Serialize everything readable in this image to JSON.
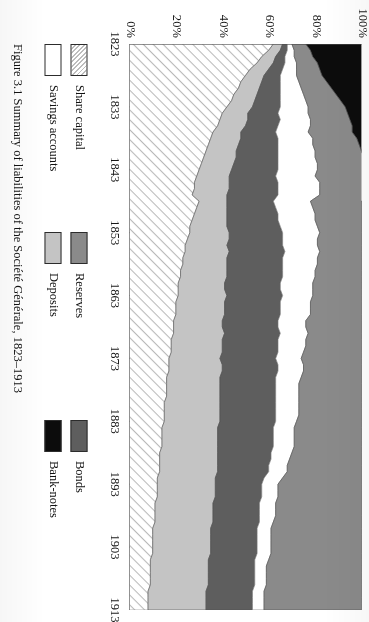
{
  "figure": {
    "caption": "Figure 3.1  Summary of liabilities of the Société Générale, 1823–1913"
  },
  "legend": {
    "columns": [
      {
        "entries": [
          {
            "label": "Share capital",
            "swatch": "hatch-diagonal",
            "color": "#ffffff"
          },
          {
            "label": "Savings accounts",
            "swatch": "solid-white",
            "color": "#ffffff"
          }
        ]
      },
      {
        "entries": [
          {
            "label": "Reserves",
            "swatch": "solid",
            "color": "#8a8a8a"
          },
          {
            "label": "Deposits",
            "swatch": "solid",
            "color": "#c4c4c4"
          }
        ]
      },
      {
        "entries": [
          {
            "label": "Bonds",
            "swatch": "solid",
            "color": "#5e5e5e"
          },
          {
            "label": "Bank-notes",
            "swatch": "solid",
            "color": "#0c0c0c"
          }
        ]
      }
    ]
  },
  "chart_data": {
    "type": "area",
    "stacked": true,
    "normalized": true,
    "title": "Summary of liabilities of the Société Générale, 1823–1913",
    "xlabel": "",
    "ylabel": "",
    "xlim": [
      1823,
      1913
    ],
    "ylim": [
      0,
      100
    ],
    "grid": false,
    "legend_position": "below-plot",
    "xticks": [
      "1823",
      "1833",
      "1843",
      "1853",
      "1863",
      "1873",
      "1883",
      "1893",
      "1903",
      "1913"
    ],
    "xtick_values": [
      1823,
      1833,
      1843,
      1853,
      1863,
      1873,
      1883,
      1893,
      1903,
      1913
    ],
    "yticks": [
      "0%",
      "20%",
      "40%",
      "60%",
      "80%",
      "100%"
    ],
    "ytick_values": [
      0,
      20,
      40,
      60,
      80,
      100
    ],
    "x": [
      1823,
      1824,
      1825,
      1826,
      1827,
      1828,
      1829,
      1830,
      1831,
      1832,
      1833,
      1834,
      1835,
      1836,
      1837,
      1838,
      1839,
      1840,
      1841,
      1842,
      1843,
      1844,
      1845,
      1846,
      1847,
      1848,
      1849,
      1850,
      1851,
      1852,
      1853,
      1854,
      1855,
      1856,
      1857,
      1858,
      1859,
      1860,
      1861,
      1862,
      1863,
      1864,
      1865,
      1866,
      1867,
      1868,
      1869,
      1870,
      1871,
      1872,
      1873,
      1874,
      1875,
      1876,
      1877,
      1878,
      1879,
      1880,
      1881,
      1882,
      1883,
      1884,
      1885,
      1886,
      1887,
      1888,
      1889,
      1890,
      1891,
      1892,
      1893,
      1894,
      1895,
      1896,
      1897,
      1898,
      1899,
      1900,
      1901,
      1902,
      1903,
      1904,
      1905,
      1906,
      1907,
      1908,
      1909,
      1910,
      1911,
      1912,
      1913
    ],
    "series": [
      {
        "name": "Share capital",
        "style": "hatch-diagonal",
        "color": "#ffffff",
        "values": [
          62,
          60,
          57,
          55,
          52,
          50,
          48,
          47,
          45,
          44,
          42,
          40,
          39,
          38,
          36,
          35,
          34,
          33,
          32,
          31,
          30,
          29,
          28,
          28,
          27,
          30,
          29,
          28,
          27,
          26,
          26,
          25,
          24,
          24,
          23,
          23,
          22,
          22,
          21,
          21,
          21,
          20,
          20,
          20,
          19,
          19,
          19,
          18,
          18,
          18,
          17,
          17,
          17,
          16,
          16,
          16,
          16,
          15,
          15,
          15,
          15,
          14,
          14,
          14,
          14,
          13,
          13,
          13,
          13,
          12,
          12,
          12,
          12,
          11,
          11,
          11,
          11,
          10,
          10,
          10,
          10,
          10,
          9,
          9,
          9,
          9,
          9,
          8,
          8,
          8,
          8
        ]
      },
      {
        "name": "Deposits",
        "style": "solid",
        "color": "#c4c4c4",
        "values": [
          4,
          5,
          6,
          7,
          8,
          8,
          9,
          9,
          10,
          10,
          11,
          11,
          12,
          12,
          12,
          13,
          13,
          13,
          14,
          14,
          14,
          14,
          15,
          15,
          15,
          12,
          13,
          14,
          15,
          16,
          17,
          18,
          18,
          19,
          19,
          19,
          20,
          20,
          20,
          20,
          21,
          21,
          21,
          21,
          21,
          21,
          22,
          22,
          22,
          22,
          22,
          23,
          23,
          23,
          23,
          23,
          23,
          24,
          24,
          24,
          24,
          24,
          24,
          24,
          24,
          25,
          25,
          25,
          25,
          25,
          25,
          25,
          25,
          25,
          25,
          25,
          25,
          25,
          25,
          25,
          25,
          25,
          25,
          25,
          25,
          25,
          25,
          25,
          25,
          25,
          25
        ]
      },
      {
        "name": "Bonds",
        "style": "solid",
        "color": "#5e5e5e",
        "values": [
          2,
          3,
          4,
          5,
          6,
          7,
          8,
          9,
          10,
          11,
          12,
          13,
          14,
          14,
          15,
          16,
          17,
          18,
          18,
          19,
          20,
          20,
          21,
          21,
          22,
          20,
          21,
          22,
          22,
          23,
          23,
          23,
          24,
          24,
          24,
          24,
          24,
          24,
          24,
          24,
          24,
          24,
          24,
          24,
          24,
          24,
          24,
          24,
          24,
          24,
          24,
          24,
          24,
          24,
          24,
          24,
          24,
          24,
          24,
          24,
          24,
          24,
          24,
          24,
          24,
          23,
          23,
          22,
          22,
          21,
          20,
          20,
          20,
          20,
          20,
          20,
          20,
          20,
          20,
          20,
          20,
          20,
          20,
          20,
          20,
          20,
          20,
          20,
          20,
          20,
          20
        ]
      },
      {
        "name": "Savings accounts",
        "style": "solid-white",
        "color": "#ffffff",
        "values": [
          2,
          3,
          4,
          5,
          6,
          7,
          8,
          9,
          10,
          11,
          12,
          13,
          13,
          14,
          14,
          15,
          15,
          16,
          16,
          17,
          17,
          17,
          18,
          18,
          18,
          16,
          16,
          16,
          16,
          16,
          16,
          15,
          15,
          15,
          15,
          15,
          14,
          14,
          14,
          14,
          13,
          13,
          13,
          13,
          12,
          12,
          12,
          12,
          12,
          11,
          11,
          11,
          11,
          11,
          10,
          10,
          10,
          10,
          10,
          10,
          9,
          9,
          9,
          9,
          9,
          9,
          8,
          8,
          8,
          8,
          7,
          7,
          7,
          7,
          7,
          7,
          6,
          6,
          6,
          6,
          6,
          6,
          6,
          5,
          5,
          5,
          5,
          5,
          5,
          5,
          5
        ]
      },
      {
        "name": "Reserves",
        "style": "solid",
        "color": "#8a8a8a",
        "values": [
          6,
          7,
          8,
          9,
          10,
          11,
          12,
          13,
          14,
          15,
          16,
          17,
          17,
          18,
          19,
          19,
          20,
          20,
          21,
          21,
          21,
          22,
          22,
          22,
          22,
          22,
          21,
          20,
          20,
          19,
          18,
          19,
          19,
          18,
          19,
          19,
          20,
          20,
          21,
          21,
          21,
          22,
          22,
          22,
          24,
          24,
          23,
          24,
          24,
          25,
          26,
          25,
          25,
          26,
          27,
          27,
          27,
          27,
          27,
          27,
          28,
          29,
          29,
          29,
          29,
          30,
          31,
          32,
          32,
          34,
          36,
          36,
          36,
          37,
          37,
          37,
          38,
          39,
          39,
          39,
          39,
          39,
          40,
          41,
          41,
          41,
          41,
          42,
          42,
          42,
          42
        ]
      },
      {
        "name": "Bank-notes",
        "style": "solid",
        "color": "#0c0c0c",
        "values": [
          24,
          22,
          21,
          19,
          18,
          17,
          15,
          13,
          11,
          9,
          7,
          6,
          5,
          4,
          4,
          2,
          1,
          0,
          0,
          0,
          0,
          0,
          0,
          0,
          0,
          0,
          0,
          0,
          0,
          0,
          0,
          0,
          0,
          0,
          0,
          0,
          0,
          0,
          0,
          0,
          0,
          0,
          0,
          0,
          0,
          0,
          0,
          0,
          0,
          0,
          0,
          0,
          0,
          0,
          0,
          0,
          0,
          0,
          0,
          0,
          0,
          0,
          0,
          0,
          0,
          0,
          0,
          0,
          0,
          0,
          0,
          0,
          0,
          0,
          0,
          0,
          0,
          0,
          0,
          0,
          0,
          0,
          0,
          0,
          0,
          0,
          0,
          0,
          0,
          0,
          0
        ]
      }
    ]
  }
}
